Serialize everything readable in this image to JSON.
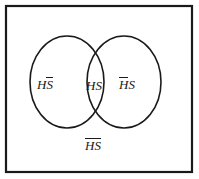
{
  "figure": {
    "type": "venn-diagram",
    "title": "",
    "universe_shape": "rectangle",
    "set_count": 2,
    "background_color": "#ffffff",
    "stroke_color": "#1a1a1a",
    "text_color": "#1a1a1a"
  },
  "regions": {
    "left_only": {
      "name": "H-and-not-S",
      "base": "H",
      "second": "S",
      "second_bar": true,
      "plain_text": "HS̄"
    },
    "intersection": {
      "name": "H-and-S",
      "first": "H",
      "second": "S",
      "plain_text": "HS"
    },
    "right_only": {
      "name": "not-H-and-S",
      "first": "H",
      "first_bar": true,
      "second": "S",
      "plain_text": "H̄S"
    },
    "outside": {
      "name": "not-H-and-not-S",
      "both": "HS",
      "both_bar": true,
      "plain_text": "H̄S̄"
    }
  },
  "geometry": {
    "rect": {
      "x": 6,
      "y": 6,
      "width": 186,
      "height": 166,
      "stroke_width": 2.2
    },
    "left_circle": {
      "cx": 67,
      "cy": 82,
      "rx": 37,
      "ry": 46,
      "stroke_width": 1.6
    },
    "right_circle": {
      "cx": 124,
      "cy": 82,
      "rx": 37,
      "ry": 46,
      "stroke_width": 1.6
    }
  }
}
